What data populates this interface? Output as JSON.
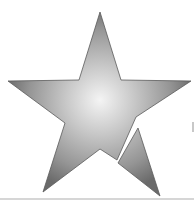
{
  "image": {
    "subject": "star-icon",
    "description": "Five-pointed star with radial gray gradient; lower-right point broken off as separate fragment",
    "colors": {
      "highlight": "#f2f2f2",
      "mid": "#bdbdbd",
      "shadow": "#6e6e6e",
      "outline": "#5a5a5a",
      "background": "#ffffff",
      "rule": "#d6d6d6"
    },
    "star_main_points": "100,12 121,80 191,81 136,117 117,160 100,149 43,192 65,123 8,81 79,80",
    "fragment_points": "138,128 160,196 118,163"
  }
}
